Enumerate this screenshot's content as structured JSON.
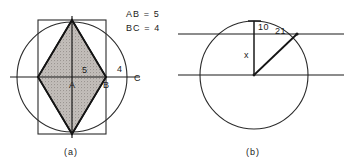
{
  "figure": {
    "caption_a": "(a)",
    "caption_b": "(b)",
    "panel_a": {
      "legend": {
        "line1": "AB = 5",
        "line2": "BC = 4"
      },
      "labels": {
        "point_a": "A",
        "point_b": "B",
        "point_c": "C",
        "len_5": "5",
        "len_4": "4"
      },
      "shapes": {
        "circle": "circle",
        "rectangle": "inscribed-rectangle",
        "rhombus": "shaded-rhombus",
        "horizontal_axis": "horizontal-diameter",
        "vertical_axis": "vertical-diameter"
      }
    },
    "panel_b": {
      "labels": {
        "len_10": "10",
        "len_21": "21",
        "unknown_x": "x"
      },
      "shapes": {
        "circle": "circle",
        "chord_upper": "upper-horizontal-line",
        "chord_lower": "lower-horizontal-line",
        "vertical_segment": "vertical-segment-x",
        "radius_segment": "radius-segment"
      }
    }
  },
  "colors": {
    "ink": "#1a1a1a",
    "stroke": "#2b2b2b",
    "shade": "#b9b4b0",
    "paper": "#ffffff"
  }
}
